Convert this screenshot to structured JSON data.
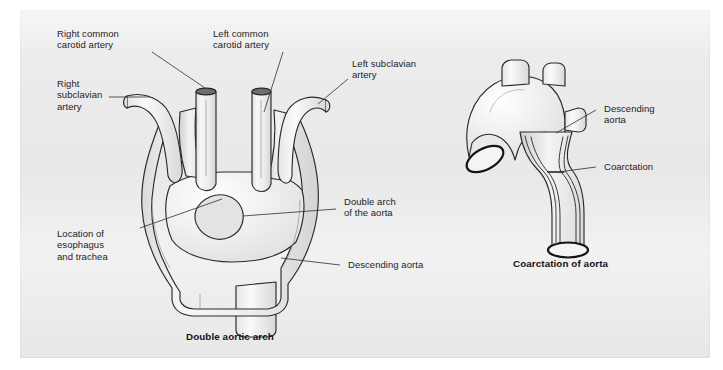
{
  "figure": {
    "kind": "medical-illustration",
    "background_color": "#ececed",
    "ink_color": "#1d1d1f",
    "vessel_fill": "#f2f2f3",
    "panels": [
      {
        "id": "double-aortic-arch",
        "caption": "Double aortic arch",
        "labels": [
          "Right common\ncarotid artery",
          "Right\nsubclavian\nartery",
          "Left common\ncarotid artery",
          "Left subclavian\nartery",
          "Double arch\nof the aorta",
          "Location of\nesophagus\nand trachea",
          "Descending aorta"
        ]
      },
      {
        "id": "coarctation-of-aorta",
        "caption": "Coarctation of aorta",
        "labels": [
          "Descending\naorta",
          "Coarctation"
        ]
      }
    ]
  },
  "left_diagram": {
    "caption": "Double aortic arch",
    "label_right_common_carotid": "Right common\ncarotid artery",
    "label_right_subclavian": "Right\nsubclavian\nartery",
    "label_left_common_carotid": "Left common\ncarotid artery",
    "label_left_subclavian": "Left subclavian\nartery",
    "label_double_arch": "Double arch\nof the aorta",
    "label_esophagus_trachea": "Location of\nesophagus\nand trachea",
    "label_descending_aorta": "Descending aorta"
  },
  "right_diagram": {
    "caption": "Coarctation of aorta",
    "label_descending_aorta": "Descending\naorta",
    "label_coarctation": "Coarctation"
  }
}
